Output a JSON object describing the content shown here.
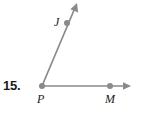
{
  "exercise": {
    "number_label": "15.",
    "type": "angle-figure"
  },
  "figure": {
    "kind": "angle",
    "stroke_color": "#8a8a8a",
    "point_color": "#8a8a8a",
    "label_color": "#1a1a1a",
    "background": "#ffffff",
    "vertex": {
      "name": "P",
      "x": 42,
      "y": 86
    },
    "points": [
      {
        "name": "P",
        "x": 42,
        "y": 86,
        "label_dx": -5,
        "label_dy": 7
      },
      {
        "name": "J",
        "x": 67,
        "y": 23,
        "label_dx": -13,
        "label_dy": -7
      },
      {
        "name": "M",
        "x": 110,
        "y": 86,
        "label_dx": -5,
        "label_dy": 7
      }
    ],
    "rays": [
      {
        "name": "ray-PJ",
        "from": "P",
        "through": "J",
        "arrow_tip": {
          "x": 77,
          "y": 3
        },
        "has_arrowhead": true
      },
      {
        "name": "ray-PM",
        "from": "P",
        "through": "M",
        "arrow_tip": {
          "x": 131,
          "y": 86
        },
        "has_arrowhead": true
      }
    ],
    "labels": {
      "P": "P",
      "J": "J",
      "M": "M"
    }
  }
}
